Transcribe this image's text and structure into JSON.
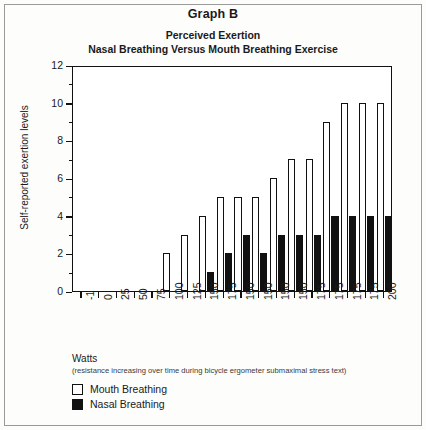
{
  "figure": {
    "graph_label": "Graph B",
    "subtitle_line1": "Perceived Exertion",
    "subtitle_line2": "Nasal Breathing Versus Mouth Breathing Exercise"
  },
  "axis_caption": "Watts",
  "axis_note": "(resistance increasing over time during bicycle ergometer submaximal stress text)",
  "legend": {
    "items": [
      {
        "label": "Mouth Breathing",
        "swatch": "white"
      },
      {
        "label": "Nasal Breathing",
        "swatch": "black"
      }
    ]
  },
  "colors": {
    "mouth_fill": "#ffffff",
    "nasal_fill": "#111111",
    "axis": "#111111",
    "background": "#ffffff"
  },
  "chart_data": {
    "type": "bar",
    "xlabel": "Watts",
    "ylabel": "Self-reported exertion levels",
    "ylim": [
      0,
      12
    ],
    "yticks": [
      0,
      2,
      4,
      6,
      8,
      10,
      12
    ],
    "yticks_minor": [
      1,
      3,
      5,
      7,
      9,
      11
    ],
    "grid": false,
    "legend_position": "below-axis-left",
    "categories": [
      "-1",
      "0",
      "25",
      "50",
      "75",
      "100",
      "125",
      "150",
      "175",
      "150",
      "150",
      "150",
      "150",
      "175",
      "175",
      "175",
      "175",
      "200"
    ],
    "series": [
      {
        "name": "Mouth Breathing",
        "values": [
          0,
          0,
          0,
          0,
          0,
          2,
          3,
          4,
          5,
          5,
          5,
          6,
          7,
          7,
          9,
          10,
          10,
          10
        ]
      },
      {
        "name": "Nasal Breathing",
        "values": [
          0,
          0,
          0,
          0,
          0,
          0,
          0,
          1,
          2,
          3,
          2,
          3,
          3,
          3,
          4,
          4,
          4,
          4
        ]
      }
    ]
  }
}
